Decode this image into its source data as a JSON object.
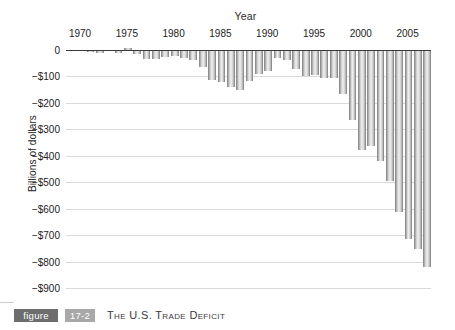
{
  "caption": {
    "figure_label": "figure",
    "figure_number": "17-2",
    "title": "The U.S. Trade Deficit"
  },
  "chart_data": {
    "type": "bar",
    "title": "The U.S. Trade Deficit",
    "xlabel": "Year",
    "ylabel": "Billions of dollars",
    "ylim": [
      -900,
      0
    ],
    "ytick_labels": [
      "0",
      "−$100",
      "−$200",
      "−$300",
      "−$400",
      "−$500",
      "−$600",
      "−$700",
      "−$800",
      "−$900"
    ],
    "ytick_values": [
      0,
      -100,
      -200,
      -300,
      -400,
      -500,
      -600,
      -700,
      -800,
      -900
    ],
    "xtick_labels": [
      "1970",
      "1975",
      "1980",
      "1985",
      "1990",
      "1995",
      "2000",
      "2005"
    ],
    "xtick_values": [
      1970,
      1975,
      1980,
      1985,
      1990,
      1995,
      2000,
      2005
    ],
    "grid": true,
    "legend": false,
    "units": "Billions of dollars",
    "categories": [
      1969,
      1970,
      1971,
      1972,
      1973,
      1974,
      1975,
      1976,
      1977,
      1978,
      1979,
      1980,
      1981,
      1982,
      1983,
      1984,
      1985,
      1986,
      1987,
      1988,
      1989,
      1990,
      1991,
      1992,
      1993,
      1994,
      1995,
      1996,
      1997,
      1998,
      1999,
      2000,
      2001,
      2002,
      2003,
      2004,
      2005,
      2006,
      2007
    ],
    "values": [
      -1,
      -3,
      -9,
      -12,
      -3,
      -12,
      9,
      -15,
      -35,
      -34,
      -28,
      -22,
      -30,
      -37,
      -66,
      -114,
      -120,
      -139,
      -152,
      -119,
      -92,
      -81,
      -31,
      -39,
      -70,
      -98,
      -96,
      -104,
      -105,
      -165,
      -263,
      -377,
      -362,
      -421,
      -494,
      -611,
      -714,
      -754,
      -819
    ],
    "annotations": []
  }
}
